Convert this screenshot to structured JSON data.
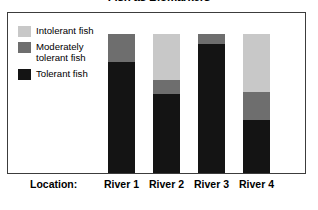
{
  "chart_data": {
    "type": "bar",
    "subtype": "stacked-bar-100",
    "title": "Fish as Biomarkers",
    "xlabel": "Location:",
    "ylabel": "",
    "grid": false,
    "legend_position": "inside-left",
    "axis_labels_visible": false,
    "ylim": [
      0,
      100
    ],
    "categories": [
      "River 1",
      "River 2",
      "River 3",
      "River 4"
    ],
    "series": [
      {
        "name": "Intolerant fish",
        "color": "#c8c8c8",
        "values": [
          0,
          33,
          0,
          42
        ]
      },
      {
        "name": "Moderately tolerant fish",
        "color": "#6e6e6e",
        "values": [
          20,
          10,
          7,
          20
        ]
      },
      {
        "name": "Tolerant fish",
        "color": "#141414",
        "values": [
          80,
          57,
          93,
          38
        ]
      }
    ]
  },
  "chart": {
    "title": "Fish as Biomarkers",
    "axis": {
      "title": "Location:",
      "ticks": [
        "River 1",
        "River 2",
        "River 3",
        "River 4"
      ]
    },
    "legend": {
      "items": [
        {
          "label": "Intolerant fish",
          "color": "#c8c8c8",
          "swatch_name": "legend-swatch-intolerant"
        },
        {
          "label": "Moderately tolerant fish",
          "color": "#6e6e6e",
          "swatch_name": "legend-swatch-moderately-tolerant"
        },
        {
          "label": "Tolerant fish",
          "color": "#141414",
          "swatch_name": "legend-swatch-tolerant"
        }
      ]
    },
    "colors": {
      "intolerant": "#c8c8c8",
      "moderately_tolerant": "#6e6e6e",
      "tolerant": "#141414",
      "frame": "#3c3c3c",
      "background": "#ffffff"
    }
  }
}
